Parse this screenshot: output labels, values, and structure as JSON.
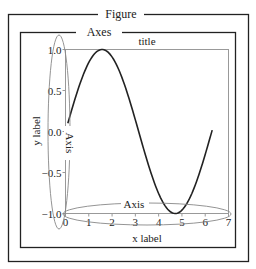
{
  "figure": {
    "frame_label": "Figure",
    "axes_frame_label": "Axes",
    "title": "title",
    "xlabel": "x label",
    "ylabel": "y label",
    "x_axis_annotation": "Axis",
    "y_axis_annotation": "Axis"
  },
  "colors": {
    "frame": "#222222",
    "spine": "#999999",
    "curve": "#222222",
    "annotation": "#888888",
    "text": "#222222"
  },
  "chart_data": {
    "type": "line",
    "title": "title",
    "xlabel": "x label",
    "ylabel": "y label",
    "xlim": [
      0,
      7
    ],
    "ylim": [
      -1.0,
      1.0
    ],
    "x_ticks": [
      "0",
      "1",
      "2",
      "3",
      "4",
      "5",
      "6",
      "7"
    ],
    "y_ticks": [
      "1.0",
      "0.5",
      "0.0",
      "-0.5",
      "-1.0"
    ],
    "grid": false,
    "series": [
      {
        "name": "sin(x)",
        "function": "sin",
        "x_range": [
          0.1,
          6.3
        ],
        "x": [
          0.1,
          0.5,
          1.0,
          1.57,
          2.0,
          2.5,
          3.0,
          3.5,
          4.0,
          4.5,
          4.71,
          5.0,
          5.5,
          6.0,
          6.3
        ],
        "y": [
          0.1,
          0.48,
          0.84,
          1.0,
          0.91,
          0.6,
          0.14,
          -0.35,
          -0.76,
          -0.98,
          -1.0,
          -0.96,
          -0.71,
          -0.28,
          0.02
        ]
      }
    ],
    "annotations": [
      {
        "text": "Figure",
        "target": "outer figure frame"
      },
      {
        "text": "Axes",
        "target": "axes frame"
      },
      {
        "text": "Axis",
        "target": "x axis (ellipse)"
      },
      {
        "text": "Axis",
        "target": "y axis (ellipse)"
      }
    ]
  }
}
